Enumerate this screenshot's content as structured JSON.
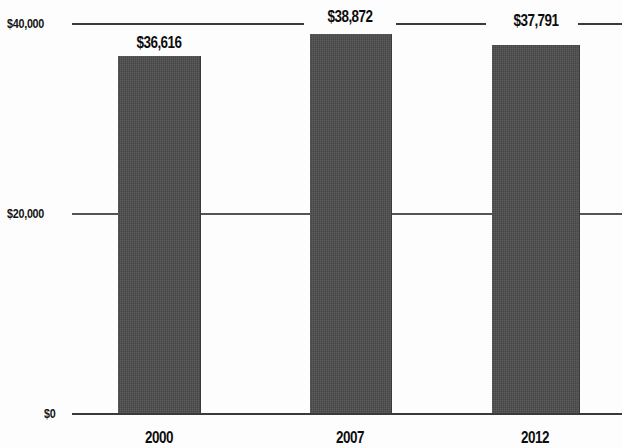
{
  "chart_data": {
    "type": "bar",
    "title": "",
    "subtitle": "",
    "xlabel": "",
    "ylabel": "",
    "categories": [
      "2000",
      "2007",
      "2012"
    ],
    "values": [
      36616,
      38872,
      37791
    ],
    "value_labels": [
      "$36,616",
      "$38,872",
      "$37,791"
    ],
    "series": [
      {
        "name": "",
        "values": [
          36616,
          38872,
          37791
        ]
      }
    ],
    "ylim": [
      0,
      40000
    ],
    "yticks": [
      0,
      20000,
      40000
    ],
    "ytick_labels": [
      "$0",
      "$20,000",
      "$40,000"
    ],
    "grid": true,
    "legend": "none",
    "bar_color": "#4c4c4c",
    "gridline_color": "#3a3a3a",
    "text_color": "#0d0d0d",
    "background_color": "#fdfdfd"
  },
  "axis": {
    "y": {
      "ticks": [
        {
          "label": "$40,000",
          "value": 40000
        },
        {
          "label": "$20,000",
          "value": 20000
        },
        {
          "label": "$0",
          "value": 0
        }
      ]
    },
    "x": {
      "ticks": [
        {
          "label": "2000"
        },
        {
          "label": "2007"
        },
        {
          "label": "2012"
        }
      ]
    }
  },
  "bars": [
    {
      "category": "2000",
      "value": 36616,
      "label": "$36,616"
    },
    {
      "category": "2007",
      "value": 38872,
      "label": "$38,872"
    },
    {
      "category": "2012",
      "value": 37791,
      "label": "$37,791"
    }
  ]
}
